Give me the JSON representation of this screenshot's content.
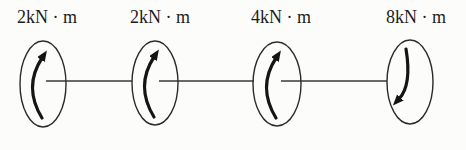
{
  "figure": {
    "type": "shaft-torque-diagram",
    "background": "#fcfcfa",
    "line_color": "#3a3a3a",
    "ellipse_color": "#2b2b2b",
    "arrow_color": "#151515",
    "label_color": "#1c1c1c",
    "shaft_y": 81,
    "shaft_segments": [
      {
        "x1": 46,
        "x2": 132
      },
      {
        "x1": 159,
        "x2": 254
      },
      {
        "x1": 281,
        "x2": 387
      }
    ],
    "discs": [
      {
        "label": "2kN · m",
        "cx": 43,
        "cy": 84,
        "rx": 23,
        "ry": 43,
        "arrow": "up",
        "label_x": 47,
        "label_y": 23
      },
      {
        "label": "2kN · m",
        "cx": 155,
        "cy": 83,
        "rx": 23,
        "ry": 42,
        "arrow": "up",
        "label_x": 160,
        "label_y": 23
      },
      {
        "label": "4kN · m",
        "cx": 277,
        "cy": 84,
        "rx": 24,
        "ry": 42,
        "arrow": "up",
        "label_x": 281,
        "label_y": 23
      },
      {
        "label": "8kN · m",
        "cx": 410,
        "cy": 82,
        "rx": 23,
        "ry": 42,
        "arrow": "down",
        "label_x": 416,
        "label_y": 23
      }
    ]
  }
}
